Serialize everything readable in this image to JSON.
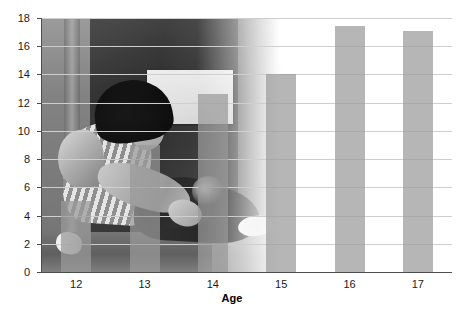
{
  "chart_data": {
    "type": "bar",
    "title": "",
    "xlabel": "Age",
    "ylabel": "Percent",
    "categories": [
      "12",
      "13",
      "14",
      "15",
      "16",
      "17"
    ],
    "values": [
      5.0,
      9.0,
      12.6,
      14.0,
      17.4,
      17.1
    ],
    "ylim": [
      0,
      18
    ],
    "ytick_labels": [
      "0",
      "2",
      "4",
      "6",
      "8",
      "10",
      "12",
      "14",
      "16",
      "18"
    ],
    "ytick_values": [
      0,
      2,
      4,
      6,
      8,
      10,
      12,
      14,
      16,
      18
    ],
    "grid": true,
    "legend": "none",
    "bar_color": "#9a9a9a",
    "axis_color": "#4d4d4d",
    "grid_color": "#cfcfcf",
    "background": "photograph of a teenager sitting on the floor, head down"
  },
  "figure": {
    "background_image_alt": "grayscale photo of a seated teenager leaning forward against a wall"
  }
}
